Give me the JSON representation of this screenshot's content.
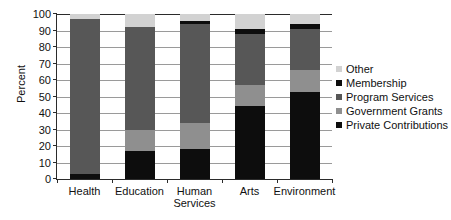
{
  "chart_data": {
    "type": "bar",
    "subtype": "stacked-bar-percent",
    "title": "",
    "xlabel": "",
    "ylabel": "Percent",
    "ylim": [
      0,
      100
    ],
    "yticks": [
      0,
      10,
      20,
      30,
      40,
      50,
      60,
      70,
      80,
      90,
      100
    ],
    "ytick_labels": [
      "0",
      "10",
      "20",
      "30",
      "40",
      "50",
      "60",
      "70",
      "80",
      "90",
      "100"
    ],
    "grid": true,
    "grid_axis": "y",
    "legend_position": "right",
    "categories": [
      "Health",
      "Education",
      "Human Services",
      "Arts",
      "Environment"
    ],
    "category_lines": [
      [
        "Health"
      ],
      [
        "Education"
      ],
      [
        "Human",
        "Services"
      ],
      [
        "Arts"
      ],
      [
        "Environment"
      ]
    ],
    "series": [
      {
        "name": "Private Contributions",
        "color": "#0d0d0d",
        "values": [
          3,
          17,
          18,
          44,
          53
        ]
      },
      {
        "name": "Government Grants",
        "color": "#8f8f8f",
        "values": [
          0,
          13,
          16,
          13,
          13
        ]
      },
      {
        "name": "Program Services",
        "color": "#575757",
        "values": [
          94,
          62,
          60,
          31,
          25
        ]
      },
      {
        "name": "Membership",
        "color": "#0d0d0d",
        "values": [
          0,
          0,
          2,
          3,
          3
        ]
      },
      {
        "name": "Other",
        "color": "#d2d2d2",
        "values": [
          3,
          8,
          4,
          9,
          6
        ]
      }
    ],
    "legend_entries": [
      {
        "label": "Other",
        "color": "#d2d2d2"
      },
      {
        "label": "Membership",
        "color": "#0d0d0d"
      },
      {
        "label": "Program Services",
        "color": "#575757"
      },
      {
        "label": "Government Grants",
        "color": "#8f8f8f"
      },
      {
        "label": "Private Contributions",
        "color": "#0d0d0d"
      }
    ]
  },
  "axis": {
    "axis_color": "#2b2b2b",
    "grid_color": "#9a9a9a"
  }
}
